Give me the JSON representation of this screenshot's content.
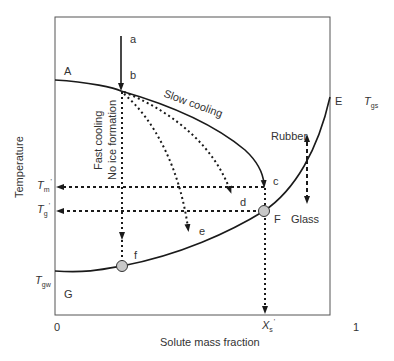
{
  "diagram": {
    "type": "state diagram (supplemented phase diagram)",
    "axes": {
      "xlabel": "Solute mass fraction",
      "ylabel": "Temperature",
      "x_ticks": [
        "0",
        "X's",
        "1"
      ],
      "y_ticks": [
        "T'm",
        "T'g",
        "Tgw"
      ]
    },
    "points": {
      "A": "A",
      "a": "a",
      "b": "b",
      "c": "c",
      "d": "d",
      "e": "e",
      "E": "E",
      "F": "F",
      "f": "f",
      "G": "G"
    },
    "annotations": {
      "slow_cooling": "Slow cooling",
      "fast_cooling_line1": "Fast cooling",
      "fast_cooling_line2": "No ice formation",
      "rubber": "Rubber",
      "glass": "Glass"
    },
    "tick_labels": {
      "tm": {
        "main": "T",
        "sub": "m",
        "sup": "'"
      },
      "tg": {
        "main": "T",
        "sub": "g",
        "sup": "'"
      },
      "tgw": {
        "main": "T",
        "sub": "gw"
      },
      "tgs": {
        "main": "T",
        "sub": "gs"
      },
      "xs": {
        "main": "X",
        "sub": "s",
        "sup": "'"
      },
      "x0": "0",
      "x1": "1"
    },
    "colors": {
      "line": "#1a1a1a",
      "marker_fill": "#c8c8c8",
      "frame": "#555555"
    }
  }
}
